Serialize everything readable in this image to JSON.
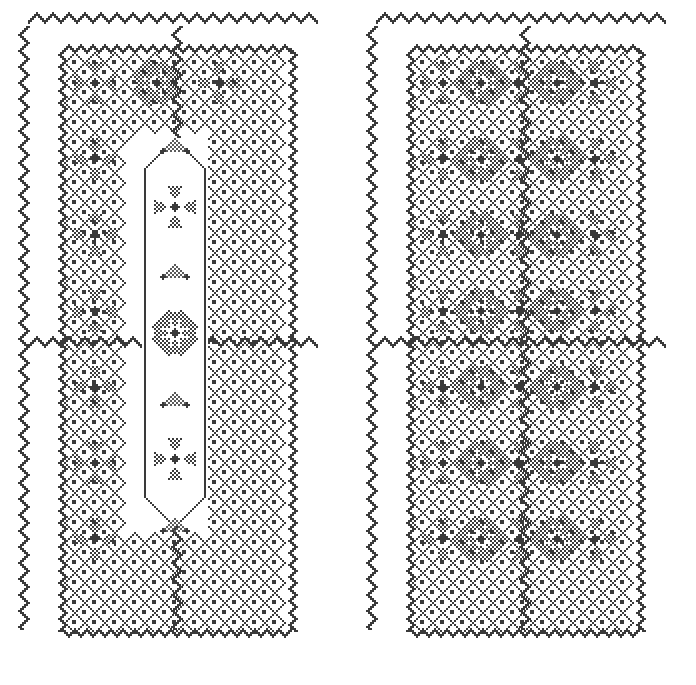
{
  "canvas": {
    "width": 696,
    "height": 685,
    "background_color": "#ffffff",
    "stitch_color": "#3a3a3a",
    "title": "Cross-Stitch Pattern Chart",
    "description": "Two rectangular embroidery pattern panels rendered as monochrome cross-stitch charts"
  },
  "grid": {
    "cell_px": 2,
    "stitch_dot_px": 2,
    "columns_total": 348,
    "rows_total": 342
  },
  "palette": {
    "stitch": "#3a3a3a",
    "stitch_light": "#5a5a5a",
    "paper": "#ffffff"
  },
  "panels": [
    {
      "id": "left-panel",
      "name": "Panel with open center column",
      "origin_x": 18,
      "origin_y": 12,
      "width": 318,
      "height": 661,
      "has_open_center": true,
      "center_motif": "sparse-dot-diamond",
      "border": {
        "type": "zigzag",
        "top": true,
        "bottom": true,
        "left": true,
        "right": true,
        "amplitude_cells": 4,
        "period_cells": 8,
        "rows": 2
      },
      "field": {
        "type": "diamond-lattice",
        "motif": "eight-petal-flower",
        "motif_columns": 3,
        "motif_rows": 7,
        "lattice_spacing_cells": 10
      }
    },
    {
      "id": "right-panel",
      "name": "Panel with filled field",
      "origin_x": 366,
      "origin_y": 12,
      "width": 318,
      "height": 661,
      "has_open_center": false,
      "center_motif": "none",
      "border": {
        "type": "zigzag",
        "top": true,
        "bottom": true,
        "left": true,
        "right": true,
        "amplitude_cells": 4,
        "period_cells": 8,
        "rows": 2
      },
      "field": {
        "type": "diamond-lattice",
        "motif": "eight-petal-flower",
        "motif_columns": 5,
        "motif_rows": 7,
        "lattice_spacing_cells": 10
      }
    }
  ],
  "motifs": {
    "eight_petal_flower": {
      "name": "eight-petal-flower",
      "petals": 8,
      "fill": "checkerboard",
      "size_cells": 21,
      "center": "solid-diamond"
    },
    "diamond_lattice": {
      "name": "diamond-lattice",
      "outline": "single-stitch-diagonal",
      "center_dot": true,
      "size_cells": 10
    },
    "zigzag_border": {
      "name": "zigzag-border",
      "stroke_cells": 2,
      "amplitude_cells": 4
    },
    "sparse_dot_panel": {
      "name": "sparse-dot-diamond",
      "density": "low",
      "arrangement": "triangular-gradient"
    }
  },
  "labels": {
    "alt_text": "Two monochrome cross-stitch embroidery pattern panels",
    "panel_left_label": "Left panel",
    "panel_right_label": "Right panel"
  }
}
